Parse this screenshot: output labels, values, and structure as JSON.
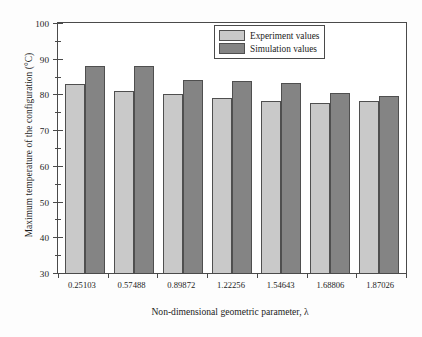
{
  "chart_data": {
    "type": "bar",
    "title": "",
    "xlabel": "Non-dimensional geometric parameter, λ",
    "ylabel": "Maximum temperature of the configuration (°C)",
    "categories": [
      "0.25103",
      "0.57488",
      "0.89872",
      "1.22256",
      "1.54643",
      "1.68806",
      "1.87026"
    ],
    "series": [
      {
        "name": "Experiment values",
        "color": "#c9c9c9",
        "values": [
          82.8,
          81.1,
          80.1,
          79.0,
          78.3,
          77.6,
          78.1
        ]
      },
      {
        "name": "Simulation values",
        "color": "#848484",
        "values": [
          88.1,
          88.1,
          84.0,
          83.8,
          83.2,
          80.3,
          79.6
        ]
      }
    ],
    "ylim": [
      30,
      100
    ],
    "yticks": [
      30,
      40,
      50,
      60,
      70,
      80,
      90,
      100
    ],
    "ytick_labels": [
      "30",
      "40",
      "50",
      "60",
      "70",
      "80",
      "90",
      "100"
    ],
    "y_minor_ticks": [
      35,
      45,
      55,
      65,
      75,
      85,
      95
    ],
    "grid": false,
    "legend_position": "top-right"
  },
  "legend": {
    "entries": [
      {
        "label": "Experiment values",
        "swatch": "experiment-swatch"
      },
      {
        "label": "Simulation values",
        "swatch": "simulation-swatch"
      }
    ]
  },
  "axes": {
    "y_title": "Maximum temperature of the configuration (°C)",
    "x_title": "Non-dimensional geometric parameter, λ"
  }
}
